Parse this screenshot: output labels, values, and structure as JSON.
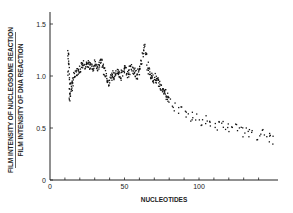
{
  "chart_data": {
    "type": "scatter",
    "title": "",
    "xlabel": "NUCLEOTIDES",
    "ylabel_numerator": "FILM INTENSITY OF NUCLEOSOME REACTION",
    "ylabel_denominator": "FILM INTENSITY OF DNA REACTION",
    "xlim": [
      0,
      150
    ],
    "ylim": [
      0,
      1.5
    ],
    "x_ticks": [
      0,
      50,
      100
    ],
    "x_minor_ticks": [
      10,
      20,
      30,
      40,
      60,
      70,
      80,
      90,
      110,
      120,
      130,
      140
    ],
    "y_ticks": [
      0,
      0.5,
      1.0,
      1.5
    ],
    "y_tick_labels": [
      "0",
      "0.5",
      "1.0",
      "1.5"
    ],
    "grid": false,
    "legend": null,
    "series": [
      {
        "name": "intensity ratio",
        "x": [
          12,
          12,
          12,
          13,
          13,
          13,
          14,
          14,
          15,
          16,
          17,
          18,
          19,
          20,
          21,
          22,
          23,
          24,
          25,
          26,
          27,
          28,
          29,
          30,
          31,
          32,
          33,
          34,
          35,
          36,
          37,
          38,
          39,
          40,
          41,
          42,
          43,
          44,
          45,
          46,
          47,
          48,
          49,
          50,
          51,
          52,
          53,
          54,
          55,
          56,
          57,
          58,
          59,
          60,
          61,
          62,
          63,
          64,
          65,
          66,
          67,
          68,
          69,
          70,
          71,
          72,
          73,
          74,
          75,
          76,
          77,
          78,
          79,
          80,
          82,
          84,
          86,
          88,
          90,
          92,
          94,
          96,
          98,
          100,
          102,
          104,
          106,
          108,
          110,
          112,
          114,
          116,
          118,
          120,
          122,
          124,
          126,
          128,
          130,
          132,
          134,
          136,
          138,
          140,
          142,
          144,
          146,
          148,
          150
        ],
        "values": [
          1.22,
          1.15,
          1.05,
          0.95,
          0.85,
          0.8,
          0.88,
          0.92,
          0.95,
          1.0,
          1.03,
          1.05,
          1.07,
          1.08,
          1.1,
          1.12,
          1.08,
          1.1,
          1.13,
          1.1,
          1.12,
          1.08,
          1.1,
          1.14,
          1.1,
          1.08,
          1.12,
          1.15,
          1.1,
          1.05,
          1.02,
          0.98,
          0.95,
          0.98,
          1.0,
          1.02,
          1.0,
          1.03,
          1.05,
          1.02,
          1.0,
          1.04,
          1.06,
          1.08,
          1.05,
          1.03,
          1.06,
          1.1,
          1.07,
          1.05,
          1.02,
          1.0,
          1.05,
          1.1,
          1.15,
          1.22,
          1.28,
          1.2,
          1.1,
          1.05,
          1.02,
          1.0,
          0.98,
          1.0,
          0.97,
          0.95,
          0.92,
          0.9,
          0.88,
          0.86,
          0.84,
          0.82,
          0.8,
          0.78,
          0.74,
          0.7,
          0.68,
          0.66,
          0.65,
          0.62,
          0.6,
          0.62,
          0.6,
          0.58,
          0.57,
          0.58,
          0.56,
          0.55,
          0.55,
          0.53,
          0.52,
          0.54,
          0.5,
          0.52,
          0.48,
          0.5,
          0.48,
          0.47,
          0.5,
          0.46,
          0.45,
          0.48,
          0.44,
          0.46,
          0.45,
          0.43,
          0.42,
          0.41,
          0.4
        ]
      }
    ]
  },
  "labels": {
    "x_axis_title": "NUCLEOTIDES",
    "y_axis_title_top": "FILM INTENSITY OF NUCLEOSOME REACTION",
    "y_axis_title_bottom": "FILM INTENSITY OF DNA REACTION"
  }
}
